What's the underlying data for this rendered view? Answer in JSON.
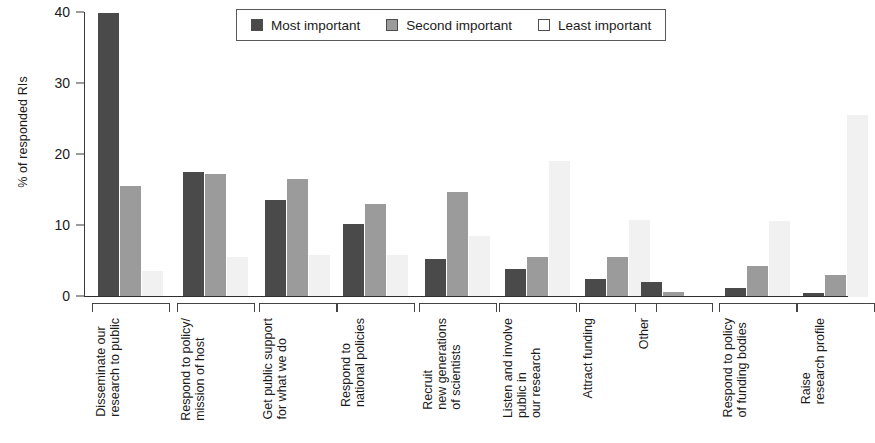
{
  "chart_data": {
    "type": "bar",
    "title": "",
    "subtitle": "",
    "xlabel": "",
    "ylabel": "% of responded RIs",
    "ylim": [
      0,
      40
    ],
    "yticks": [
      0,
      10,
      20,
      30,
      40
    ],
    "ytick_labels": [
      "0",
      "10",
      "20",
      "30",
      "40"
    ],
    "grid": false,
    "legend_position": "top-center",
    "categories": [
      "Disseminate our research to public",
      "Respond to policy/ mission of host",
      "Get public support for what we do",
      "Respond to national policies",
      "Recruit new generations of scientists",
      "Listen and involve public in our research",
      "Attract funding",
      "Other",
      "Respond to policy of funding bodies",
      "Raise research profile"
    ],
    "category_lines": [
      [
        "Disseminate our",
        "research to public"
      ],
      [
        "Respond to policy/",
        "mission of host"
      ],
      [
        "Get public support",
        "for what we do"
      ],
      [
        "Respond to",
        "national policies"
      ],
      [
        "Recruit",
        "new generations",
        "of scientists"
      ],
      [
        "Listen and involve",
        "public in",
        "our research"
      ],
      [
        "Attract funding"
      ],
      [
        "Other"
      ],
      [
        "Respond to policy",
        "of funding bodies"
      ],
      [
        "Raise",
        "research profile"
      ]
    ],
    "series": [
      {
        "name": "Most important",
        "color": "#4a4a4a",
        "values": [
          40.0,
          17.6,
          13.7,
          10.3,
          5.4,
          4.0,
          2.5,
          2.1,
          1.3,
          0.6
        ]
      },
      {
        "name": "Second important",
        "color": "#9b9b9b",
        "values": [
          15.7,
          17.3,
          16.6,
          13.1,
          14.8,
          5.7,
          5.7,
          0.7,
          4.4,
          3.1
        ]
      },
      {
        "name": "Least important",
        "color": "#f1f1f1",
        "values": [
          3.7,
          5.6,
          5.9,
          5.9,
          8.6,
          19.1,
          10.8,
          0.0,
          10.7,
          25.6
        ]
      }
    ]
  },
  "legend": {
    "items": [
      {
        "label": "Most important",
        "color": "#4a4a4a"
      },
      {
        "label": "Second important",
        "color": "#9b9b9b"
      },
      {
        "label": "Least important",
        "color": "#ffffff"
      }
    ]
  }
}
